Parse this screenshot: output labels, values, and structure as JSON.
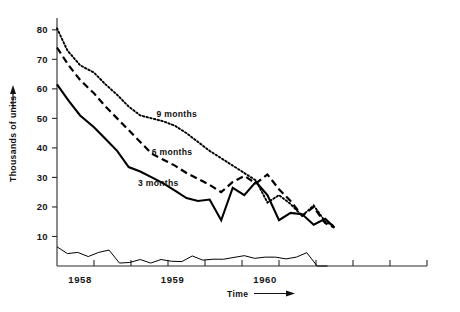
{
  "chart_data": {
    "type": "line",
    "title": "",
    "xlabel": "Time",
    "ylabel": "Thousands of units",
    "ylim": [
      0,
      84
    ],
    "xlim": [
      0,
      16
    ],
    "grid": false,
    "legend": "inline-labels",
    "yticks": [
      10,
      20,
      30,
      40,
      50,
      60,
      70,
      80
    ],
    "ytick_labels": [
      "10",
      "20",
      "30",
      "40",
      "50",
      "60",
      "70",
      "80"
    ],
    "xtick_labels": [
      "1958",
      "1959",
      "1960"
    ],
    "xtick_positions": [
      1.0,
      5.0,
      9.0
    ],
    "x_major_tick_count": 9,
    "annotations": [
      {
        "text": "9 months",
        "x": 4.3,
        "y": 50.5
      },
      {
        "text": "6 months",
        "x": 4.1,
        "y": 37.5
      },
      {
        "text": "3 months",
        "x": 3.5,
        "y": 27.0
      }
    ],
    "series": [
      {
        "name": "9 months",
        "style": "dotted",
        "x": [
          0.0,
          0.45,
          1.0,
          1.6,
          2.1,
          2.6,
          3.1,
          3.6,
          4.1,
          4.6,
          5.1,
          5.6,
          6.1,
          6.6,
          7.1,
          7.6,
          8.1,
          8.6,
          9.1,
          9.6,
          10.1,
          10.6,
          11.1,
          11.6,
          12.0
        ],
        "y": [
          80.5,
          73.0,
          68.0,
          65.5,
          61.5,
          58.0,
          54.0,
          51.0,
          50.0,
          49.0,
          47.5,
          45.0,
          42.0,
          39.0,
          36.5,
          34.0,
          31.5,
          29.0,
          21.5,
          24.0,
          21.0,
          17.0,
          20.5,
          15.0,
          13.5
        ]
      },
      {
        "name": "6 months",
        "style": "dashed",
        "x": [
          0.0,
          0.5,
          1.0,
          1.6,
          2.1,
          2.6,
          3.1,
          3.6,
          4.1,
          4.6,
          5.1,
          5.6,
          6.1,
          6.6,
          7.1,
          7.6,
          8.1,
          8.6,
          9.1,
          9.6,
          10.1,
          10.6,
          11.1,
          11.6,
          12.0
        ],
        "y": [
          74.0,
          68.0,
          63.0,
          58.5,
          54.0,
          50.0,
          46.0,
          42.0,
          38.0,
          36.0,
          34.0,
          31.5,
          29.5,
          27.5,
          25.0,
          28.5,
          30.5,
          28.0,
          31.0,
          26.0,
          22.0,
          17.0,
          20.0,
          14.5,
          13.0
        ]
      },
      {
        "name": "3 months",
        "style": "solid",
        "x": [
          0.0,
          0.5,
          1.0,
          1.6,
          2.1,
          2.6,
          3.1,
          3.6,
          4.1,
          4.6,
          5.1,
          5.6,
          6.1,
          6.6,
          7.1,
          7.6,
          8.1,
          8.6,
          9.1,
          9.6,
          10.1,
          10.6,
          11.1,
          11.6,
          12.0
        ],
        "y": [
          61.5,
          56.0,
          51.0,
          47.0,
          43.0,
          39.0,
          33.5,
          32.0,
          30.0,
          28.0,
          25.5,
          23.0,
          22.0,
          22.5,
          15.5,
          26.5,
          24.0,
          28.5,
          24.0,
          15.5,
          18.0,
          17.5,
          14.0,
          16.0,
          13.0
        ]
      },
      {
        "name": "baseline-series",
        "style": "thin",
        "x": [
          0.0,
          0.45,
          0.9,
          1.35,
          1.8,
          2.25,
          2.7,
          3.15,
          3.6,
          4.05,
          4.5,
          4.95,
          5.4,
          5.85,
          6.3,
          6.75,
          7.2,
          7.65,
          8.1,
          8.55,
          9.0,
          9.45,
          9.9,
          10.35,
          10.8,
          11.25,
          11.7
        ],
        "y": [
          6.5,
          4.2,
          4.6,
          3.2,
          4.6,
          5.4,
          1.0,
          1.2,
          2.2,
          1.0,
          2.2,
          1.6,
          1.5,
          3.4,
          2.0,
          2.3,
          2.3,
          2.9,
          3.5,
          2.6,
          3.0,
          3.0,
          2.4,
          3.0,
          4.5,
          0,
          0
        ]
      }
    ]
  },
  "axis_titles": {
    "y": "Thousands of units",
    "x": "Time"
  }
}
